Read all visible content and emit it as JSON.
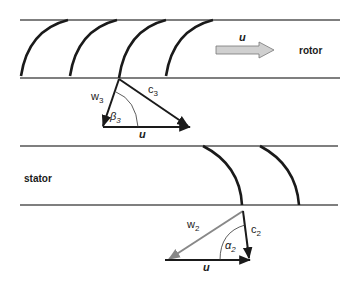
{
  "rotor": {
    "label": "rotor",
    "motion_arrow_label": "u",
    "triangle": {
      "w": {
        "base": "w",
        "sub": "3"
      },
      "c": {
        "base": "c",
        "sub": "3"
      },
      "angle": {
        "base": "β",
        "sub": "3"
      },
      "u": "u"
    }
  },
  "stator": {
    "label": "stator",
    "triangle": {
      "w": {
        "base": "w",
        "sub": "2"
      },
      "c": {
        "base": "c",
        "sub": "2"
      },
      "angle": {
        "base": "α",
        "sub": "2"
      },
      "u": "u"
    }
  },
  "colors": {
    "line": "#555555",
    "blade": "#1a1a1a",
    "w2_vector": "#888888",
    "u_arrow_fill": "#d0d0d0"
  }
}
